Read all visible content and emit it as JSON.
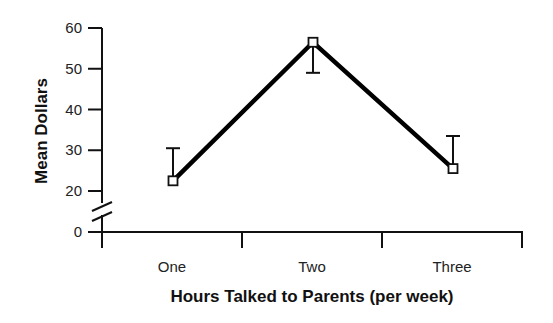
{
  "chart_data": {
    "type": "line",
    "title": "",
    "xlabel": "Hours Talked to Parents (per week)",
    "ylabel": "Mean Dollars",
    "categories": [
      "One",
      "Two",
      "Three"
    ],
    "series": [
      {
        "name": "Mean Dollars",
        "values": [
          22.5,
          56.5,
          25.5
        ],
        "error_bars": [
          {
            "direction": "up",
            "end": 30.5
          },
          {
            "direction": "down",
            "end": 49
          },
          {
            "direction": "up",
            "end": 33.5
          }
        ]
      }
    ],
    "yticks": [
      0,
      20,
      30,
      40,
      50,
      60
    ],
    "ylim": [
      0,
      60
    ],
    "axis_break": "between 0 and 20",
    "grid": false,
    "legend": "none",
    "marker": "open-square",
    "line_color": "#000000"
  }
}
